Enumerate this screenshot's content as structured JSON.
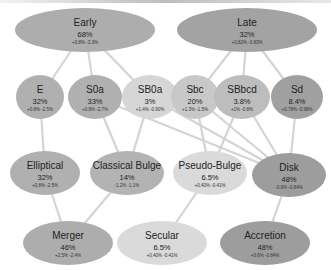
{
  "diagram": {
    "colors": {
      "dark": "#9a9a9a",
      "medium": "#adadad",
      "light": "#c9c9c9",
      "lighter": "#d9d9d9",
      "edge": "#d4d4d4",
      "background": "#ffffff"
    },
    "nodes": [
      {
        "id": "early",
        "label": "Early",
        "pct": "68%",
        "range": "+0.8%  -3.3%",
        "cx": 85,
        "cy": 30,
        "rx": 70,
        "ry": 22,
        "fill": "#adadad"
      },
      {
        "id": "late",
        "label": "Late",
        "pct": "32%",
        "range": "+0.82%  -0.83%",
        "cx": 247,
        "cy": 30,
        "rx": 70,
        "ry": 22,
        "fill": "#a3a3a3"
      },
      {
        "id": "e",
        "label": "E",
        "pct": "32%",
        "range": "+0.8%  -2.5%",
        "cx": 40,
        "cy": 97,
        "rx": 24,
        "ry": 22,
        "fill": "#b0b0b0"
      },
      {
        "id": "s0a",
        "label": "S0a",
        "pct": "33%",
        "range": "+0.8%  -2.7%",
        "cx": 95,
        "cy": 97,
        "rx": 27,
        "ry": 22,
        "fill": "#b0b0b0"
      },
      {
        "id": "sb0a",
        "label": "SB0a",
        "pct": "3%",
        "range": "+1.4%  -0.90%",
        "cx": 150,
        "cy": 97,
        "rx": 28,
        "ry": 22,
        "fill": "#d6d6d6"
      },
      {
        "id": "sbc",
        "label": "Sbc",
        "pct": "20%",
        "range": "+1.3%  -1.5%",
        "cx": 195,
        "cy": 97,
        "rx": 24,
        "ry": 22,
        "fill": "#c8c8c8"
      },
      {
        "id": "sbbcd",
        "label": "SBbcd",
        "pct": "3.8%",
        "range": "+1%  -0.8%",
        "cx": 242,
        "cy": 97,
        "rx": 28,
        "ry": 22,
        "fill": "#bdbdbd"
      },
      {
        "id": "sd",
        "label": "Sd",
        "pct": "8.4%",
        "range": "+0.78%  -0.98%",
        "cx": 297,
        "cy": 97,
        "rx": 26,
        "ry": 22,
        "fill": "#a0a0a0"
      },
      {
        "id": "elliptical",
        "label": "Elliptical",
        "pct": "32%",
        "range": "+0.8%  -2.5%",
        "cx": 45,
        "cy": 173,
        "rx": 35,
        "ry": 22,
        "fill": "#b0b0b0"
      },
      {
        "id": "classical-bulge",
        "label": "Classical Bulge",
        "pct": "14%",
        "range": "-1.2%  -1.1%",
        "cx": 127,
        "cy": 173,
        "rx": 37,
        "ry": 22,
        "fill": "#b3b3b3"
      },
      {
        "id": "pseudo-bulge",
        "label": "Pseudo-Bulge",
        "pct": "6.5%",
        "range": "+0.40%  -0.41%",
        "cx": 210,
        "cy": 173,
        "rx": 37,
        "ry": 22,
        "fill": "#dadada"
      },
      {
        "id": "disk",
        "label": "Disk",
        "pct": "48%",
        "range": "-0.6%  -0.84%",
        "cx": 289,
        "cy": 175,
        "rx": 37,
        "ry": 22,
        "fill": "#9d9d9d"
      },
      {
        "id": "merger",
        "label": "Merger",
        "pct": "46%",
        "range": "+2.5%  -2.4%",
        "cx": 68,
        "cy": 243,
        "rx": 45,
        "ry": 22,
        "fill": "#adadad"
      },
      {
        "id": "secular",
        "label": "Secular",
        "pct": "6.5%",
        "range": "+0.40%  -0.41%",
        "cx": 162,
        "cy": 243,
        "rx": 45,
        "ry": 22,
        "fill": "#dadada"
      },
      {
        "id": "accretion",
        "label": "Accretion",
        "pct": "48%",
        "range": "+0.6%  -0.84%",
        "cx": 265,
        "cy": 243,
        "rx": 45,
        "ry": 22,
        "fill": "#9d9d9d"
      }
    ],
    "edges": [
      [
        "early",
        "e"
      ],
      [
        "early",
        "s0a"
      ],
      [
        "early",
        "sb0a"
      ],
      [
        "late",
        "sbc"
      ],
      [
        "late",
        "sbbcd"
      ],
      [
        "late",
        "sd"
      ],
      [
        "e",
        "elliptical"
      ],
      [
        "s0a",
        "classical-bulge"
      ],
      [
        "s0a",
        "disk"
      ],
      [
        "sb0a",
        "classical-bulge"
      ],
      [
        "sb0a",
        "disk"
      ],
      [
        "sbc",
        "pseudo-bulge"
      ],
      [
        "sbc",
        "disk"
      ],
      [
        "sbbcd",
        "pseudo-bulge"
      ],
      [
        "sbbcd",
        "disk"
      ],
      [
        "sd",
        "disk"
      ],
      [
        "elliptical",
        "merger"
      ],
      [
        "classical-bulge",
        "merger"
      ],
      [
        "pseudo-bulge",
        "secular"
      ],
      [
        "disk",
        "accretion"
      ]
    ]
  }
}
